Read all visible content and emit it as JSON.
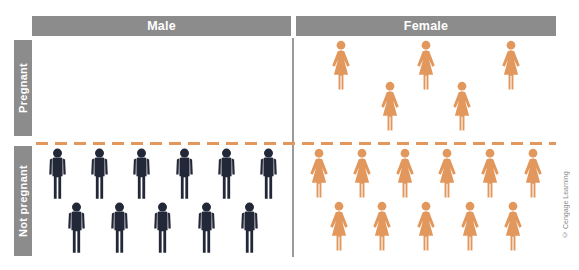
{
  "figure": {
    "title_context": "pictograph of pregnancy status by sex",
    "columns": [
      {
        "id": "male",
        "label": "Male"
      },
      {
        "id": "female",
        "label": "Female"
      }
    ],
    "rows": [
      {
        "id": "pregnant",
        "label": "Pregnant"
      },
      {
        "id": "not-pregnant",
        "label": "Not pregnant"
      }
    ],
    "cells": {
      "pregnant-male": {
        "icon": "male",
        "row_counts": [
          0,
          0
        ],
        "total": 0
      },
      "pregnant-female": {
        "icon": "female",
        "row_counts": [
          3,
          2
        ],
        "total": 5
      },
      "not-pregnant-male": {
        "icon": "male",
        "row_counts": [
          6,
          5
        ],
        "total": 11
      },
      "not-pregnant-female": {
        "icon": "female",
        "row_counts": [
          6,
          5
        ],
        "total": 11
      }
    }
  },
  "chart_data": {
    "type": "pictograph",
    "categories_x": [
      "Male",
      "Female"
    ],
    "categories_y": [
      "Pregnant",
      "Not pregnant"
    ],
    "counts": {
      "Pregnant/Male": 0,
      "Pregnant/Female": 5,
      "Not pregnant/Male": 11,
      "Not pregnant/Female": 11
    }
  },
  "credit": "© Cengage Learning",
  "colors": {
    "male_icon": "#232838",
    "female_icon": "#E2985C",
    "header_bg": "#8C8C8C",
    "row_label_bg": "#8C8C8C",
    "column_divider": "#9A9A9A",
    "dash_line": "#E2985C",
    "credit_text": "#8A8A8A",
    "background": "#FFFFFF"
  }
}
